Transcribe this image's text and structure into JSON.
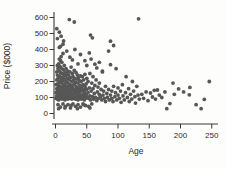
{
  "chart_data": {
    "type": "scatter",
    "title": "",
    "xlabel": "Age",
    "ylabel": "Price ($000)",
    "xlim": [
      0,
      250
    ],
    "ylim": [
      0,
      600
    ],
    "x_ticks": [
      0,
      50,
      100,
      150,
      200,
      250
    ],
    "y_ticks": [
      0,
      100,
      200,
      300,
      400,
      500,
      600
    ],
    "grid": false,
    "legend": "none",
    "point_color": "#575757",
    "axis_color": "#3a3a3a",
    "label_color": "#2b2b2b",
    "points": [
      [
        1,
        95
      ],
      [
        1,
        130
      ],
      [
        1,
        180
      ],
      [
        2,
        110
      ],
      [
        2,
        155
      ],
      [
        2,
        210
      ],
      [
        2,
        260
      ],
      [
        3,
        90
      ],
      [
        3,
        140
      ],
      [
        3,
        185
      ],
      [
        3,
        240
      ],
      [
        3,
        300
      ],
      [
        4,
        105
      ],
      [
        4,
        160
      ],
      [
        4,
        220
      ],
      [
        4,
        280
      ],
      [
        5,
        85
      ],
      [
        5,
        125
      ],
      [
        5,
        175
      ],
      [
        5,
        235
      ],
      [
        5,
        310
      ],
      [
        6,
        100
      ],
      [
        6,
        150
      ],
      [
        6,
        200
      ],
      [
        6,
        265
      ],
      [
        6,
        340
      ],
      [
        7,
        115
      ],
      [
        7,
        170
      ],
      [
        7,
        230
      ],
      [
        7,
        295
      ],
      [
        8,
        95
      ],
      [
        8,
        140
      ],
      [
        8,
        195
      ],
      [
        8,
        255
      ],
      [
        8,
        330
      ],
      [
        9,
        120
      ],
      [
        9,
        165
      ],
      [
        9,
        215
      ],
      [
        9,
        285
      ],
      [
        10,
        90
      ],
      [
        10,
        135
      ],
      [
        10,
        190
      ],
      [
        10,
        250
      ],
      [
        10,
        320
      ],
      [
        11,
        110
      ],
      [
        11,
        160
      ],
      [
        11,
        225
      ],
      [
        12,
        95
      ],
      [
        12,
        145
      ],
      [
        12,
        205
      ],
      [
        12,
        275
      ],
      [
        13,
        120
      ],
      [
        13,
        175
      ],
      [
        13,
        245
      ],
      [
        14,
        100
      ],
      [
        14,
        150
      ],
      [
        14,
        215
      ],
      [
        14,
        300
      ],
      [
        15,
        85
      ],
      [
        15,
        130
      ],
      [
        15,
        185
      ],
      [
        15,
        260
      ],
      [
        16,
        110
      ],
      [
        16,
        165
      ],
      [
        16,
        235
      ],
      [
        17,
        95
      ],
      [
        17,
        140
      ],
      [
        17,
        200
      ],
      [
        17,
        280
      ],
      [
        18,
        120
      ],
      [
        18,
        170
      ],
      [
        18,
        250
      ],
      [
        19,
        105
      ],
      [
        19,
        155
      ],
      [
        19,
        220
      ],
      [
        20,
        90
      ],
      [
        20,
        135
      ],
      [
        20,
        190
      ],
      [
        20,
        265
      ],
      [
        21,
        115
      ],
      [
        21,
        170
      ],
      [
        21,
        240
      ],
      [
        22,
        100
      ],
      [
        22,
        145
      ],
      [
        22,
        210
      ],
      [
        23,
        125
      ],
      [
        23,
        180
      ],
      [
        23,
        260
      ],
      [
        24,
        95
      ],
      [
        24,
        150
      ],
      [
        24,
        225
      ],
      [
        25,
        110
      ],
      [
        25,
        165
      ],
      [
        25,
        290
      ],
      [
        26,
        90
      ],
      [
        26,
        140
      ],
      [
        26,
        200
      ],
      [
        27,
        120
      ],
      [
        27,
        175
      ],
      [
        27,
        250
      ],
      [
        28,
        105
      ],
      [
        28,
        155
      ],
      [
        28,
        230
      ],
      [
        29,
        95
      ],
      [
        29,
        145
      ],
      [
        29,
        210
      ],
      [
        30,
        125
      ],
      [
        30,
        185
      ],
      [
        30,
        270
      ],
      [
        31,
        100
      ],
      [
        31,
        150
      ],
      [
        31,
        220
      ],
      [
        32,
        90
      ],
      [
        32,
        135
      ],
      [
        32,
        195
      ],
      [
        33,
        115
      ],
      [
        33,
        170
      ],
      [
        33,
        255
      ],
      [
        34,
        95
      ],
      [
        34,
        145
      ],
      [
        34,
        215
      ],
      [
        35,
        110
      ],
      [
        35,
        160
      ],
      [
        35,
        240
      ],
      [
        36,
        85
      ],
      [
        36,
        130
      ],
      [
        36,
        190
      ],
      [
        37,
        105
      ],
      [
        37,
        155
      ],
      [
        37,
        225
      ],
      [
        38,
        95
      ],
      [
        38,
        140
      ],
      [
        38,
        205
      ],
      [
        39,
        120
      ],
      [
        39,
        175
      ],
      [
        40,
        100
      ],
      [
        40,
        150
      ],
      [
        40,
        235
      ],
      [
        41,
        90
      ],
      [
        41,
        140
      ],
      [
        41,
        200
      ],
      [
        42,
        110
      ],
      [
        42,
        165
      ],
      [
        43,
        95
      ],
      [
        43,
        150
      ],
      [
        43,
        230
      ],
      [
        44,
        120
      ],
      [
        44,
        180
      ],
      [
        45,
        100
      ],
      [
        45,
        145
      ],
      [
        45,
        210
      ],
      [
        46,
        85
      ],
      [
        46,
        135
      ],
      [
        47,
        110
      ],
      [
        47,
        170
      ],
      [
        47,
        245
      ],
      [
        48,
        95
      ],
      [
        48,
        155
      ],
      [
        49,
        120
      ],
      [
        49,
        185
      ],
      [
        50,
        105
      ],
      [
        50,
        150
      ],
      [
        50,
        220
      ],
      [
        4,
        55
      ],
      [
        8,
        40
      ],
      [
        12,
        60
      ],
      [
        16,
        45
      ],
      [
        20,
        55
      ],
      [
        24,
        35
      ],
      [
        28,
        60
      ],
      [
        32,
        45
      ],
      [
        36,
        55
      ],
      [
        40,
        40
      ],
      [
        44,
        60
      ],
      [
        48,
        50
      ],
      [
        53,
        45
      ],
      [
        58,
        60
      ],
      [
        5,
        30
      ],
      [
        15,
        35
      ],
      [
        25,
        50
      ],
      [
        35,
        30
      ],
      [
        45,
        55
      ],
      [
        55,
        35
      ],
      [
        52,
        130
      ],
      [
        52,
        200
      ],
      [
        53,
        95
      ],
      [
        54,
        160
      ],
      [
        55,
        110
      ],
      [
        55,
        250
      ],
      [
        56,
        85
      ],
      [
        57,
        140
      ],
      [
        58,
        190
      ],
      [
        59,
        105
      ],
      [
        60,
        155
      ],
      [
        60,
        230
      ],
      [
        61,
        90
      ],
      [
        62,
        125
      ],
      [
        63,
        175
      ],
      [
        64,
        100
      ],
      [
        65,
        210
      ],
      [
        66,
        80
      ],
      [
        67,
        135
      ],
      [
        68,
        165
      ],
      [
        69,
        95
      ],
      [
        70,
        120
      ],
      [
        70,
        190
      ],
      [
        72,
        105
      ],
      [
        73,
        150
      ],
      [
        74,
        85
      ],
      [
        75,
        260
      ],
      [
        76,
        115
      ],
      [
        77,
        140
      ],
      [
        78,
        95
      ],
      [
        80,
        170
      ],
      [
        80,
        75
      ],
      [
        82,
        125
      ],
      [
        83,
        100
      ],
      [
        85,
        150
      ],
      [
        86,
        85
      ],
      [
        88,
        115
      ],
      [
        90,
        140
      ],
      [
        90,
        95
      ],
      [
        92,
        75
      ],
      [
        93,
        170
      ],
      [
        95,
        105
      ],
      [
        96,
        130
      ],
      [
        98,
        85
      ],
      [
        100,
        115
      ],
      [
        100,
        160
      ],
      [
        6,
        413
      ],
      [
        31,
        400
      ],
      [
        40,
        369
      ],
      [
        54,
        379
      ],
      [
        23,
        352
      ],
      [
        63,
        308
      ],
      [
        85,
        390
      ],
      [
        57,
        340
      ],
      [
        70,
        320
      ],
      [
        47,
        330
      ],
      [
        36,
        310
      ],
      [
        18,
        390
      ],
      [
        12,
        375
      ],
      [
        9,
        355
      ],
      [
        27,
        335
      ],
      [
        50,
        300
      ],
      [
        66,
        285
      ],
      [
        75,
        265
      ],
      [
        97,
        280
      ],
      [
        88,
        305
      ],
      [
        22,
        587
      ],
      [
        30,
        572
      ],
      [
        133,
        592
      ],
      [
        2,
        530
      ],
      [
        6,
        508
      ],
      [
        9,
        483
      ],
      [
        13,
        453
      ],
      [
        3,
        468
      ],
      [
        8,
        420
      ],
      [
        12,
        433
      ],
      [
        56,
        490
      ],
      [
        59,
        473
      ],
      [
        88,
        452
      ],
      [
        93,
        425
      ],
      [
        102,
        95
      ],
      [
        104,
        140
      ],
      [
        105,
        70
      ],
      [
        107,
        180
      ],
      [
        108,
        110
      ],
      [
        110,
        85
      ],
      [
        112,
        130
      ],
      [
        113,
        230
      ],
      [
        115,
        100
      ],
      [
        117,
        155
      ],
      [
        118,
        75
      ],
      [
        120,
        120
      ],
      [
        122,
        90
      ],
      [
        123,
        200
      ],
      [
        125,
        140
      ],
      [
        127,
        105
      ],
      [
        128,
        65
      ],
      [
        130,
        170
      ],
      [
        132,
        115
      ],
      [
        134,
        90
      ],
      [
        138,
        120
      ],
      [
        141,
        95
      ],
      [
        145,
        135
      ],
      [
        148,
        80
      ],
      [
        152,
        128
      ],
      [
        155,
        103
      ],
      [
        158,
        145
      ],
      [
        160,
        90
      ],
      [
        163,
        147
      ],
      [
        166,
        115
      ],
      [
        170,
        100
      ],
      [
        175,
        135
      ],
      [
        178,
        30
      ],
      [
        183,
        62
      ],
      [
        188,
        190
      ],
      [
        190,
        120
      ],
      [
        197,
        154
      ],
      [
        205,
        135
      ],
      [
        214,
        117
      ],
      [
        215,
        163
      ],
      [
        225,
        55
      ],
      [
        233,
        30
      ],
      [
        238,
        88
      ],
      [
        246,
        200
      ]
    ]
  }
}
